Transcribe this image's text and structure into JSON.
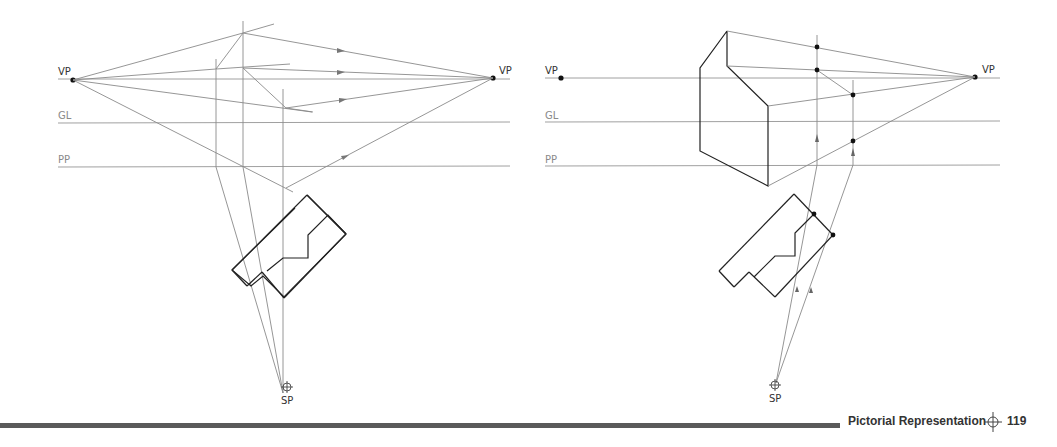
{
  "figure_left": {
    "labels": {
      "vp_left": "VP",
      "vp_right": "VP",
      "ground_line": "GL",
      "picture_plane": "PP",
      "station_point": "SP"
    }
  },
  "figure_right": {
    "labels": {
      "vp_left": "VP",
      "vp_right": "VP",
      "ground_line": "GL",
      "picture_plane": "PP",
      "station_point": "SP"
    }
  },
  "footer": {
    "section_title": "Pictorial Representation",
    "page_number": "119",
    "marker_icon": "crosshair-icon"
  },
  "colors": {
    "construction_line": "#8a8a8a",
    "object_line": "#222222",
    "footer_bar": "#5a5a5a"
  }
}
